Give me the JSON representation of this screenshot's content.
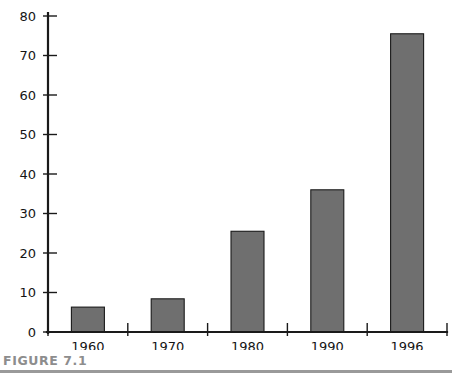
{
  "figure": {
    "caption_label": "FIGURE 7.1"
  },
  "chart_data": {
    "type": "bar",
    "title": "",
    "subtitle": "",
    "xlabel": "",
    "ylabel": "",
    "categories": [
      "1960",
      "1970",
      "1980",
      "1990",
      "1996"
    ],
    "values": [
      6.3,
      8.4,
      25.5,
      36.0,
      75.5
    ],
    "series": [
      {
        "name": "",
        "values": [
          6.3,
          8.4,
          25.5,
          36.0,
          75.5
        ]
      }
    ],
    "ylim": [
      0,
      80
    ],
    "xlim": [
      0,
      5
    ],
    "ytick_labels": [
      "0",
      "10",
      "20",
      "30",
      "40",
      "50",
      "60",
      "70",
      "80"
    ],
    "ytick_values": [
      0,
      10,
      20,
      30,
      40,
      50,
      60,
      70,
      80
    ],
    "xtick_labels": [
      "1960",
      "1970",
      "1980",
      "1990",
      "1996"
    ],
    "grid": false,
    "legend": false,
    "legend_position": "none",
    "bar_fill_color": "#6f6f6f",
    "bar_edge_color": "#1a1a1a",
    "axis_color": "#1a1a1a",
    "tick_direction": "in",
    "annotations": []
  }
}
